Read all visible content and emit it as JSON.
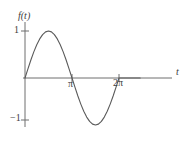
{
  "chart_data": {
    "type": "line",
    "title": "",
    "subtitle": "",
    "xlabel": "t",
    "ylabel": "f(t)",
    "function": "f(t) = sin(t)",
    "grid": false,
    "legend": null,
    "xlim": [
      0,
      7.7
    ],
    "ylim": [
      -1.25,
      1.25
    ],
    "x_tick_labels": [
      "π",
      "2π"
    ],
    "x_tick_values": [
      3.14159,
      6.28319
    ],
    "y_tick_labels": [
      "1",
      "−1"
    ],
    "y_tick_values": [
      1,
      -1
    ],
    "axis_color": "#6e6e6e",
    "curve_color": "#5a5a5a",
    "background_color": "#ffffff",
    "series": [
      {
        "name": "f(t)",
        "x": [
          0.0,
          0.1963,
          0.3927,
          0.589,
          0.7854,
          0.9817,
          1.1781,
          1.3744,
          1.5708,
          1.7671,
          1.9635,
          2.1598,
          2.3562,
          2.5525,
          2.7489,
          2.9452,
          3.1416,
          3.3379,
          3.5343,
          3.7306,
          3.927,
          4.1233,
          4.3197,
          4.516,
          4.7124,
          4.9087,
          5.1051,
          5.3014,
          5.4978,
          5.6941,
          5.8905,
          6.0868,
          6.2832
        ],
        "y": [
          0.0,
          0.1951,
          0.3827,
          0.5556,
          0.7071,
          0.8315,
          0.9239,
          0.9808,
          1.0,
          0.9808,
          0.9239,
          0.8315,
          0.7071,
          0.5556,
          0.3827,
          0.1951,
          0.0,
          -0.1951,
          -0.3827,
          -0.5556,
          -0.7071,
          -0.8315,
          -0.9239,
          -0.9808,
          -1.0,
          -0.9808,
          -0.9239,
          -0.8315,
          -0.7071,
          -0.5556,
          -0.3827,
          -0.1951,
          0.0
        ]
      }
    ],
    "annotations": []
  },
  "labels": {
    "y_axis": "f(t)",
    "x_axis": "t",
    "y_tick_top": "1",
    "y_tick_bottom": "−1",
    "x_tick_pi": "π",
    "x_tick_two_pi": "2π"
  }
}
